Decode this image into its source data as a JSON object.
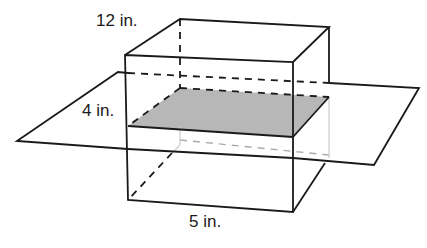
{
  "figure": {
    "type": "rectangular-prism-cross-section",
    "labels": {
      "height": "12 in.",
      "cross_section_height": "4 in.",
      "width": "5 in."
    },
    "colors": {
      "line": "#1a1a1a",
      "cross_section_fill": "#b7b7b7",
      "background": "#ffffff"
    }
  }
}
